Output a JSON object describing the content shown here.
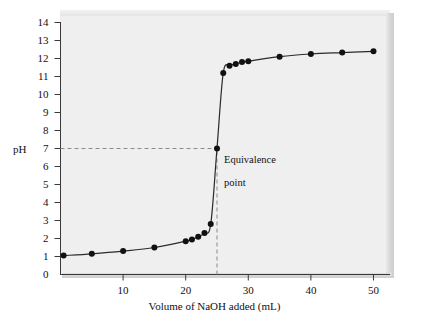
{
  "figure": {
    "background_color": "#ffffff",
    "plot_background_color": "#efefef",
    "curve_color": "#2b2b2b",
    "marker_color": "#111111",
    "guide_color": "#8a8a8a"
  },
  "axes": {
    "y_axis_label": "pH",
    "x_axis_label": "Volume of NaOH added (mL)",
    "y_ticks": [
      "0",
      "1",
      "2",
      "3",
      "4",
      "5",
      "6",
      "7",
      "8",
      "9",
      "10",
      "11",
      "12",
      "13",
      "14"
    ],
    "x_ticks": [
      "10",
      "20",
      "30",
      "40",
      "50"
    ]
  },
  "annotations": {
    "equivalence_point": {
      "line1": "Equivalence",
      "line2": "point",
      "x_value": 25,
      "y_value": 7
    }
  },
  "chart_data": {
    "type": "line",
    "title": "",
    "subtitle": "",
    "xlabel": "Volume of NaOH added (mL)",
    "ylabel": "pH",
    "xlim": [
      0,
      52
    ],
    "ylim": [
      0,
      14
    ],
    "xticks": [
      10,
      20,
      30,
      40,
      50
    ],
    "yticks": [
      0,
      1,
      2,
      3,
      4,
      5,
      6,
      7,
      8,
      9,
      10,
      11,
      12,
      13,
      14
    ],
    "grid": false,
    "legend": "none",
    "series": [
      {
        "name": "Titration curve",
        "marker": "filled-circle",
        "x": [
          0.5,
          5,
          10,
          15,
          20,
          21,
          22,
          23,
          24,
          25,
          26,
          27,
          28,
          29,
          30,
          35,
          40,
          45,
          50
        ],
        "y": [
          1.05,
          1.15,
          1.3,
          1.5,
          1.85,
          1.95,
          2.1,
          2.3,
          2.8,
          7.0,
          11.2,
          11.6,
          11.7,
          11.8,
          11.85,
          12.1,
          12.25,
          12.33,
          12.4
        ]
      }
    ],
    "guides": [
      {
        "type": "horizontal-dashed",
        "y": 7,
        "from_x": 0,
        "to_x": 25
      },
      {
        "type": "vertical-dashed",
        "x": 25,
        "from_y": 0,
        "to_y": 7
      }
    ]
  }
}
